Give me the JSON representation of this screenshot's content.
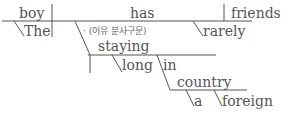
{
  "diagram": {
    "type": "sentence-diagram",
    "line_color": "#555555",
    "text_color": "#555555",
    "words": {
      "subject": "boy",
      "subject_modifier": "The",
      "verb": "has",
      "verb_modifier": "rarely",
      "object": "friends",
      "participle": "staying",
      "participle_modifier": "long",
      "preposition": "in",
      "prep_object": "country",
      "prep_object_mod_1": "a",
      "prep_object_mod_2": "foreign"
    },
    "annotation": "· (이유 분사구문)"
  }
}
